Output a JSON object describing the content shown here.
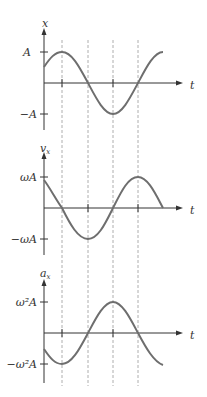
{
  "graphs": [
    {
      "y_label": "x",
      "x_label": "t",
      "pos_label": "A",
      "neg_label": "−A"
    },
    {
      "y_label": "v",
      "y_sub": "x",
      "x_label": "t",
      "pos_label": "ωA",
      "neg_label": "−ωA"
    },
    {
      "y_label": "a",
      "y_sub": "x",
      "x_label": "t",
      "pos_label": "ω²A",
      "neg_label": "−ω²A"
    }
  ],
  "colors": {
    "curve": "#6e6e6e",
    "axis": "#333333",
    "dashed": "#999999"
  }
}
